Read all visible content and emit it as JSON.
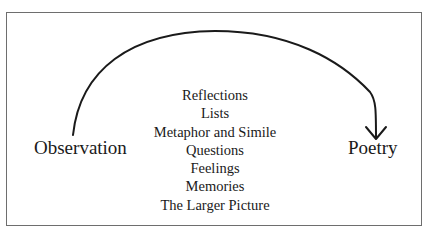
{
  "diagram": {
    "type": "process-flow",
    "start_node": {
      "label": "Observation"
    },
    "end_node": {
      "label": "Poetry"
    },
    "connector": {
      "style": "curved-arrow",
      "direction": "start-to-end"
    },
    "intermediate_items": [
      {
        "label": "Reflections"
      },
      {
        "label": "Lists"
      },
      {
        "label": "Metaphor and Simile"
      },
      {
        "label": "Questions"
      },
      {
        "label": "Feelings"
      },
      {
        "label": "Memories"
      },
      {
        "label": "The Larger Picture"
      }
    ]
  },
  "colors": {
    "line": "#1a1a1a",
    "frame": "#6e6e6e",
    "background": "#ffffff",
    "text": "#1a1a1a"
  }
}
